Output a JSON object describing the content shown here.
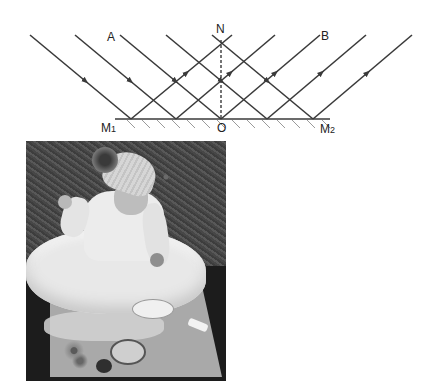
{
  "diagram": {
    "labels": {
      "normal_top": "N",
      "incident_ray": "A",
      "reflected_ray": "B",
      "mirror_left": "M",
      "mirror_left_sub": "1",
      "incidence_point": "O",
      "mirror_right": "M",
      "mirror_right_sub": "2"
    },
    "incident_rays": [
      {
        "x1": 30,
        "y1": 35,
        "x2": 131,
        "y2": 119
      },
      {
        "x1": 75,
        "y1": 35,
        "x2": 176,
        "y2": 119
      },
      {
        "x1": 120,
        "y1": 35,
        "x2": 221,
        "y2": 119
      },
      {
        "x1": 166,
        "y1": 35,
        "x2": 267,
        "y2": 119
      },
      {
        "x1": 212,
        "y1": 35,
        "x2": 313,
        "y2": 119
      }
    ],
    "reflected_rays": [
      {
        "x1": 131,
        "y1": 119,
        "x2": 232,
        "y2": 35
      },
      {
        "x1": 176,
        "y1": 119,
        "x2": 275,
        "y2": 35
      },
      {
        "x1": 221,
        "y1": 119,
        "x2": 320,
        "y2": 35
      },
      {
        "x1": 267,
        "y1": 119,
        "x2": 366,
        "y2": 35
      },
      {
        "x1": 313,
        "y1": 119,
        "x2": 412,
        "y2": 35
      }
    ],
    "mirror": {
      "x1": 115,
      "x2": 330,
      "y": 119
    },
    "normal": {
      "x": 221,
      "y1": 40,
      "y2": 119
    },
    "line_color": "#3a3a3a"
  },
  "photo": {
    "description": "Grayscale photo of a baby in a white dress and knit pom-pom hat sitting on grass beside a mirror showing her reflection"
  }
}
